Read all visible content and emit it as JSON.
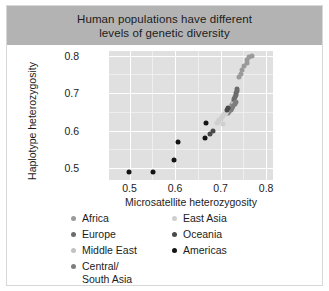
{
  "card": {
    "title_line1": "Human populations have different",
    "title_line2": "levels of genetic diversity",
    "title_band_color": "#b3b3b3",
    "background": "#ffffff",
    "border_color": "#d8d8d8"
  },
  "legend": {
    "left_column": [
      {
        "label": "Africa",
        "color": "#9a9a9a"
      },
      {
        "label": "Europe",
        "color": "#6b6b6b"
      },
      {
        "label": "Middle East",
        "color": "#c2c2c2"
      },
      {
        "label": "Central/\nSouth Asia",
        "color": "#7e7e7e"
      }
    ],
    "right_column": [
      {
        "label": "East Asia",
        "color": "#cfcfcf"
      },
      {
        "label": "Oceania",
        "color": "#4a4a4a"
      },
      {
        "label": "Americas",
        "color": "#141414"
      }
    ]
  },
  "chart_data": {
    "type": "scatter",
    "title": "Human populations have different levels of genetic diversity",
    "xlabel": "Microsatellite heterozygosity",
    "ylabel": "Haplotype heterozygosity",
    "xlim": [
      0.455,
      0.815
    ],
    "ylim": [
      0.468,
      0.812
    ],
    "xticks": [
      0.5,
      0.6,
      0.7,
      0.8
    ],
    "xticklabels": [
      "0.5",
      "0.6",
      "0.7",
      "0.8"
    ],
    "yticks": [
      0.5,
      0.6,
      0.7,
      0.8
    ],
    "yticklabels": [
      "0.5",
      "0.6",
      "0.7",
      "0.8"
    ],
    "x_minor_ticks": [
      0.55,
      0.65,
      0.75
    ],
    "y_minor_ticks": [
      0.55,
      0.65,
      0.75
    ],
    "grid": true,
    "panel_background": "#e0e0e0",
    "gridline_color": "#ffffff",
    "legend_position": "below",
    "series": [
      {
        "name": "Africa",
        "color": "#9a9a9a",
        "points": [
          [
            0.768,
            0.8
          ],
          [
            0.763,
            0.795
          ],
          [
            0.759,
            0.789
          ],
          [
            0.757,
            0.781
          ],
          [
            0.752,
            0.773
          ],
          [
            0.748,
            0.762
          ],
          [
            0.744,
            0.751
          ],
          [
            0.741,
            0.742
          ]
        ]
      },
      {
        "name": "Europe",
        "color": "#6b6b6b",
        "points": [
          [
            0.737,
            0.712
          ],
          [
            0.735,
            0.706
          ],
          [
            0.734,
            0.7
          ],
          [
            0.733,
            0.695
          ],
          [
            0.731,
            0.69
          ],
          [
            0.73,
            0.684
          ],
          [
            0.729,
            0.678
          ],
          [
            0.727,
            0.672
          ],
          [
            0.726,
            0.667
          ],
          [
            0.724,
            0.662
          ],
          [
            0.722,
            0.657
          ]
        ]
      },
      {
        "name": "Middle East",
        "color": "#c2c2c2",
        "points": [
          [
            0.728,
            0.67
          ],
          [
            0.726,
            0.664
          ],
          [
            0.723,
            0.659
          ],
          [
            0.721,
            0.654
          ],
          [
            0.719,
            0.65
          ],
          [
            0.716,
            0.646
          ]
        ]
      },
      {
        "name": "Central/South Asia",
        "color": "#7e7e7e",
        "points": [
          [
            0.733,
            0.676
          ],
          [
            0.731,
            0.671
          ],
          [
            0.728,
            0.666
          ],
          [
            0.725,
            0.661
          ],
          [
            0.722,
            0.656
          ],
          [
            0.719,
            0.652
          ],
          [
            0.716,
            0.648
          ]
        ]
      },
      {
        "name": "East Asia",
        "color": "#cfcfcf",
        "points": [
          [
            0.714,
            0.651
          ],
          [
            0.711,
            0.647
          ],
          [
            0.708,
            0.643
          ],
          [
            0.705,
            0.639
          ],
          [
            0.702,
            0.635
          ],
          [
            0.7,
            0.631
          ],
          [
            0.697,
            0.628
          ],
          [
            0.694,
            0.624
          ],
          [
            0.692,
            0.621
          ],
          [
            0.706,
            0.618
          ]
        ]
      },
      {
        "name": "Oceania",
        "color": "#4a4a4a",
        "points": [
          [
            0.716,
            0.66
          ],
          [
            0.713,
            0.655
          ],
          [
            0.684,
            0.6
          ],
          [
            0.676,
            0.592
          ]
        ]
      },
      {
        "name": "Americas",
        "color": "#141414",
        "points": [
          [
            0.499,
            0.49
          ],
          [
            0.551,
            0.49
          ],
          [
            0.598,
            0.521
          ],
          [
            0.606,
            0.57
          ],
          [
            0.665,
            0.58
          ],
          [
            0.667,
            0.621
          ]
        ]
      }
    ]
  }
}
